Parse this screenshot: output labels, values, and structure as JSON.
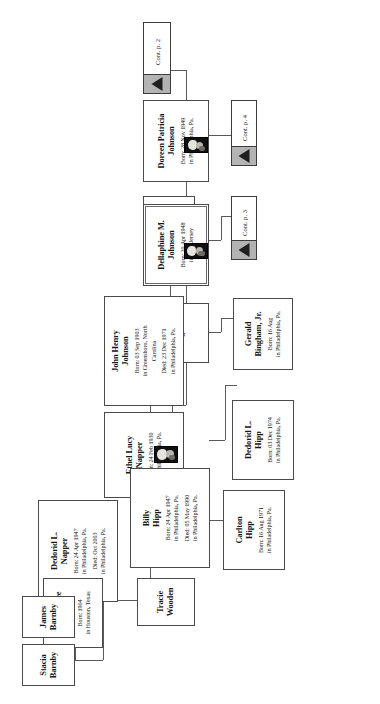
{
  "document": {
    "type": "genealogy-family-tree-chart",
    "orientation": "rotated-90-ccw",
    "page_background": "#ffffff"
  },
  "nodes": {
    "cont_p2": {
      "label": "Cont. p. 2",
      "icon": "triangle-up-icon"
    },
    "cont_p3": {
      "label": "Cont. p. 3",
      "icon": "triangle-up-icon"
    },
    "cont_p4": {
      "label": "Cont. p. 4",
      "icon": "triangle-up-icon"
    },
    "doreen": {
      "name_line1": "Doreen Patricia",
      "name_line2": "Johnson",
      "born": "Born: 28 Nov 1949",
      "place": "in Philadelphia, Pa.",
      "has_photo": true
    },
    "dennis_ivy": {
      "name_line1": "Dennis",
      "name_line2": "Ivy",
      "born": "",
      "place": "",
      "has_photo": false
    },
    "dellaphine": {
      "name_line1": "Dellaphine M.",
      "name_line2": "Johnson",
      "born": "Born: 20 Apr 1948",
      "place": "in New Jersey",
      "has_photo": true
    },
    "gerald_bingham": {
      "name_line1": "Gerald",
      "name_line2": "Bingham",
      "born": "",
      "place": "",
      "has_photo": false
    },
    "gerald_bingham_jr": {
      "name_line1": "Gerald",
      "name_line2": "Bingham, Jr.",
      "born": "Born: 16 Aug",
      "place": "in Philadelphia, Pa.",
      "has_photo": false
    },
    "john_henry": {
      "name_line1": "John Henry",
      "name_line2": "Johnson",
      "born": "Born: 03 Sep 1903",
      "place": "in Greensboro, North",
      "place2": "Carolina",
      "died": "Died: 23 Dec 1971",
      "died_place": "in Philadelphia, Pa.",
      "has_photo": false
    },
    "ethel_lucy": {
      "name_line1": "Ethel Lucy",
      "name_line2": "Napper",
      "born": "Born: 24 Feb 1930",
      "place": "in Philadelphia, Pa.",
      "has_photo": true
    },
    "dedorid_napper": {
      "name_line1": "Dedorid L.",
      "name_line2": "Napper",
      "born": "Born: 24 Apr 1947",
      "place": "in Philadelphia, Pa.",
      "died": "Died: Oct 2003",
      "died_place": "in Philadelphia, Pa.",
      "has_photo": false
    },
    "billy_hipp": {
      "name_line1": "Billy",
      "name_line2": "Hipp",
      "born": "Born: 24 Apr 1947",
      "place": "in Philadelphia, Pa.",
      "died": "Died: 05 May 1990",
      "died_place": "in Philadelphia, Pa.",
      "has_photo": false
    },
    "dedorid_hipp": {
      "name_line1": "Dedorid L.",
      "name_line2": "Hipp",
      "born": "Born: 03 Dec 1974",
      "place": "in Philadelphia, Pa.",
      "has_photo": false
    },
    "carlton_hipp": {
      "name_line1": "Carlton",
      "name_line2": "Hipp",
      "born": "Born: 16 Aug 1971",
      "place": "in Philadelphia, Pa.",
      "has_photo": false
    },
    "tracie_wooden": {
      "name_line1": "Tracie",
      "name_line2": "Wooden",
      "born": "",
      "place": "",
      "has_photo": false
    },
    "edward_lee_barnby": {
      "name_line1": "Edward Lee",
      "name_line2": "Barnby",
      "born": "Born: 1964",
      "place": "in Houston, Texas",
      "has_photo": false
    },
    "james_barnby": {
      "name_line1": "James",
      "name_line2": "Barnby",
      "born": "",
      "place": "",
      "has_photo": false
    },
    "stacia_barnby": {
      "name_line1": "Stacia",
      "name_line2": "Barnby",
      "born": "",
      "place": "",
      "has_photo": false
    }
  },
  "colors": {
    "border": "#4a4a4a",
    "line": "#5a5a5a",
    "cont_band": "#b3b3b3",
    "triangle": "#1f1f1f",
    "text": "#171717",
    "background": "#ffffff"
  }
}
